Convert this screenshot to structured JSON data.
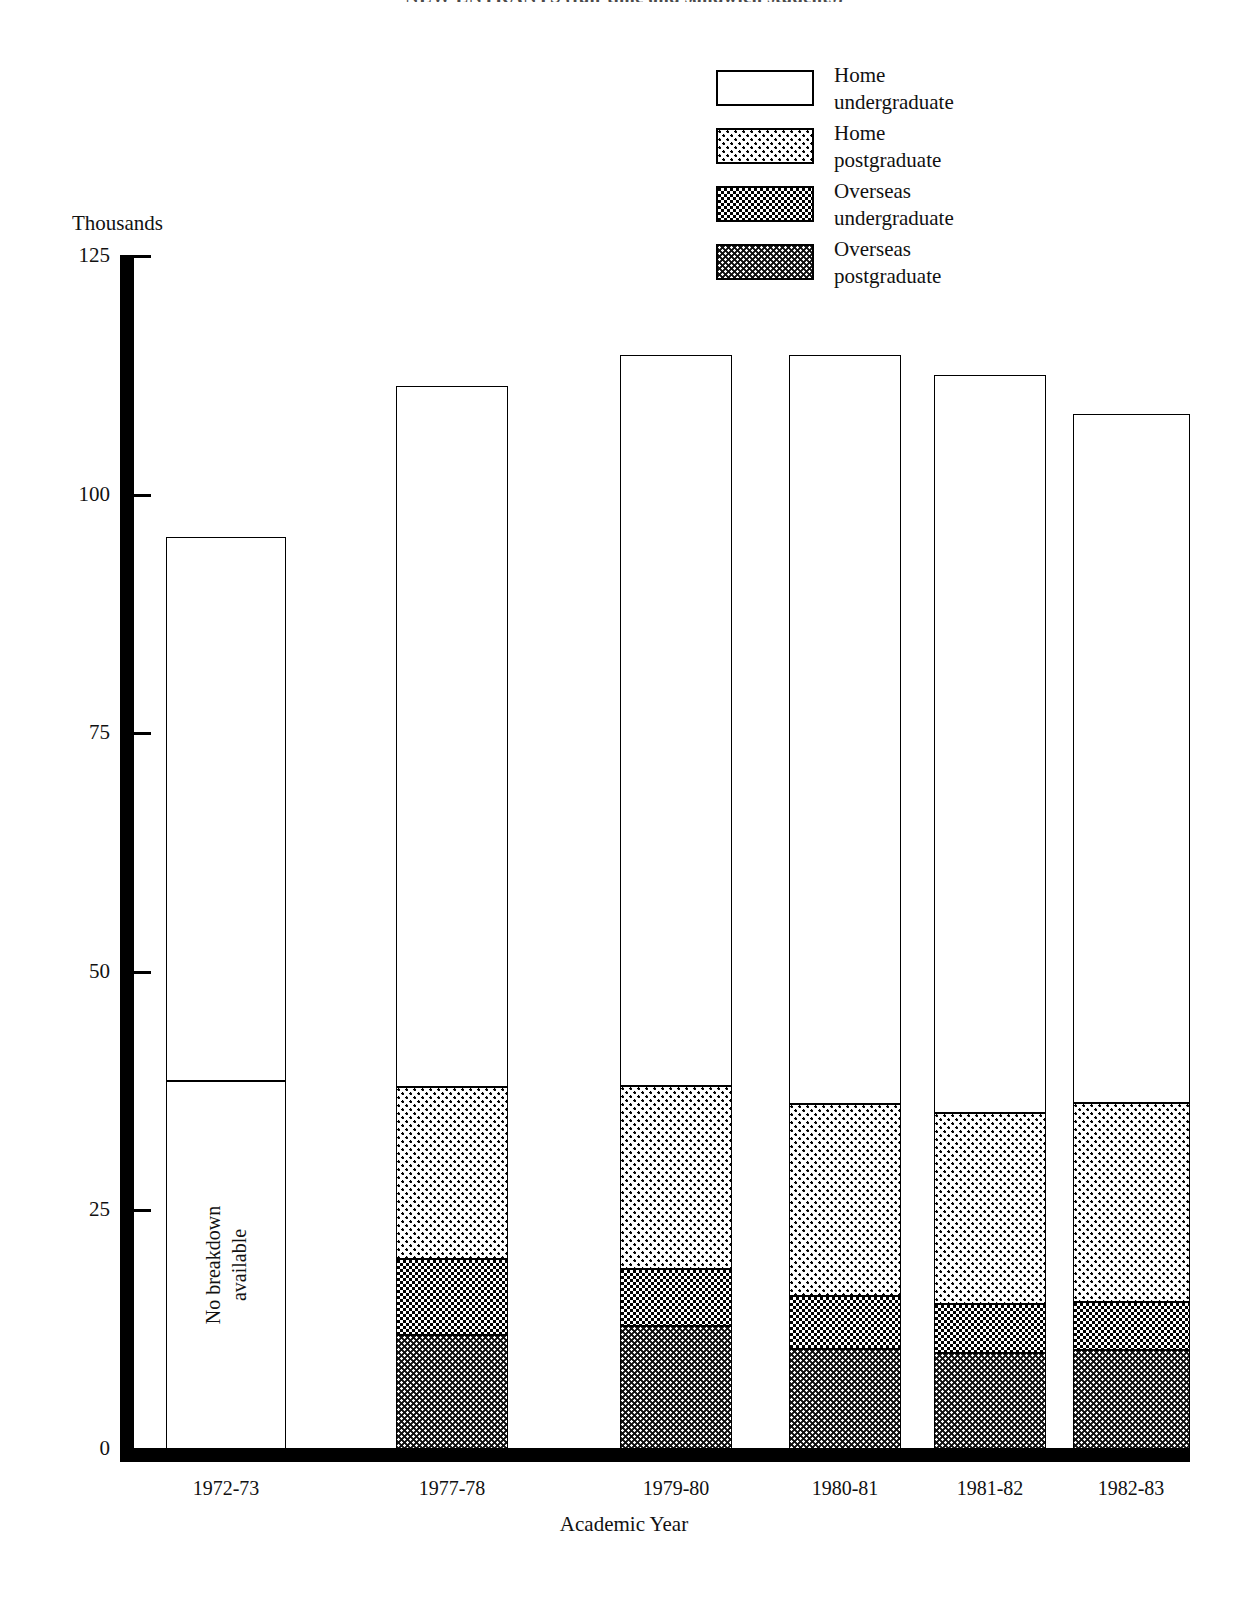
{
  "page": {
    "title": "NEW ENTRANTS (full-time and sandwich students)"
  },
  "axes": {
    "y_unit_label": "Thousands",
    "y_ticks": [
      "125",
      "100",
      "75",
      "50",
      "25",
      "0"
    ],
    "x_title": "Academic Year"
  },
  "legend": {
    "items": [
      {
        "label": "Home\nundergraduate",
        "pattern": "pat-none",
        "swatch_name": "legend-swatch-home-undergraduate"
      },
      {
        "label": "Home\npostgraduate",
        "pattern": "pat-light",
        "swatch_name": "legend-swatch-home-postgraduate"
      },
      {
        "label": "Overseas\nundergraduate",
        "pattern": "pat-mid",
        "swatch_name": "legend-swatch-overseas-undergraduate"
      },
      {
        "label": "Overseas\npostgraduate",
        "pattern": "pat-dark",
        "swatch_name": "legend-swatch-overseas-postgraduate"
      }
    ]
  },
  "annotations": {
    "no_breakdown": "No breakdown\navailable"
  },
  "chart_data": {
    "type": "bar",
    "subtype": "stacked-vertical",
    "title": "NEW ENTRANTS (full-time and sandwich students)",
    "xlabel": "Academic Year",
    "ylabel": "Thousands",
    "ylim": [
      0,
      125
    ],
    "yticks": [
      0,
      25,
      50,
      75,
      100,
      125
    ],
    "grid": false,
    "legend_position": "top-right",
    "categories": [
      "1972-73",
      "1977-78",
      "1979-80",
      "1980-81",
      "1981-82",
      "1982-83"
    ],
    "series": [
      {
        "name": "Overseas postgraduate",
        "pattern": "pat-dark",
        "values": [
          null,
          11.9,
          12.9,
          10.5,
          10.1,
          10.4
        ]
      },
      {
        "name": "Overseas undergraduate",
        "pattern": "pat-mid",
        "values": [
          null,
          8.0,
          6.0,
          5.5,
          5.1,
          5.0
        ]
      },
      {
        "name": "Home postgraduate",
        "pattern": "pat-light",
        "values": [
          null,
          18.0,
          19.1,
          20.1,
          20.0,
          20.8
        ]
      },
      {
        "name": "Home undergraduate",
        "pattern": "pat-none",
        "values": [
          null,
          73.5,
          76.6,
          78.5,
          77.3,
          72.2
        ]
      }
    ],
    "totals": [
      95.6,
      111.4,
      114.6,
      114.6,
      112.5,
      108.4
    ],
    "notes": [
      {
        "category": "1972-73",
        "text": "No breakdown available",
        "detail": "1972-73 bar is shown undivided with a single internal rule at 38.6 thousand"
      }
    ],
    "bars": [
      {
        "category": "1972-73",
        "total": 95.6,
        "breakdown_available": false,
        "segments": [
          {
            "series": "Unspecified lower",
            "pattern": "pat-none",
            "from": 0.0,
            "to": 38.6
          },
          {
            "series": "Unspecified upper",
            "pattern": "pat-none",
            "from": 38.6,
            "to": 95.6
          }
        ]
      },
      {
        "category": "1977-78",
        "total": 111.4,
        "breakdown_available": true,
        "segments": [
          {
            "series": "Overseas postgraduate",
            "pattern": "pat-dark",
            "from": 0.0,
            "to": 11.9
          },
          {
            "series": "Overseas undergraduate",
            "pattern": "pat-mid",
            "from": 11.9,
            "to": 19.9
          },
          {
            "series": "Home postgraduate",
            "pattern": "pat-light",
            "from": 19.9,
            "to": 37.9
          },
          {
            "series": "Home undergraduate",
            "pattern": "pat-none",
            "from": 37.9,
            "to": 111.4
          }
        ]
      },
      {
        "category": "1979-80",
        "total": 114.6,
        "breakdown_available": true,
        "segments": [
          {
            "series": "Overseas postgraduate",
            "pattern": "pat-dark",
            "from": 0.0,
            "to": 12.9
          },
          {
            "series": "Overseas undergraduate",
            "pattern": "pat-mid",
            "from": 12.9,
            "to": 18.9
          },
          {
            "series": "Home postgraduate",
            "pattern": "pat-light",
            "from": 18.9,
            "to": 38.0
          },
          {
            "series": "Home undergraduate",
            "pattern": "pat-none",
            "from": 38.0,
            "to": 114.6
          }
        ]
      },
      {
        "category": "1980-81",
        "total": 114.6,
        "breakdown_available": true,
        "segments": [
          {
            "series": "Overseas postgraduate",
            "pattern": "pat-dark",
            "from": 0.0,
            "to": 10.5
          },
          {
            "series": "Overseas undergraduate",
            "pattern": "pat-mid",
            "from": 10.5,
            "to": 16.0
          },
          {
            "series": "Home postgraduate",
            "pattern": "pat-light",
            "from": 16.0,
            "to": 36.1
          },
          {
            "series": "Home undergraduate",
            "pattern": "pat-none",
            "from": 36.1,
            "to": 114.6
          }
        ]
      },
      {
        "category": "1981-82",
        "total": 112.5,
        "breakdown_available": true,
        "segments": [
          {
            "series": "Overseas postgraduate",
            "pattern": "pat-dark",
            "from": 0.0,
            "to": 10.1
          },
          {
            "series": "Overseas undergraduate",
            "pattern": "pat-mid",
            "from": 10.1,
            "to": 15.2
          },
          {
            "series": "Home postgraduate",
            "pattern": "pat-light",
            "from": 15.2,
            "to": 35.2
          },
          {
            "series": "Home undergraduate",
            "pattern": "pat-none",
            "from": 35.2,
            "to": 112.5
          }
        ]
      },
      {
        "category": "1982-83",
        "total": 108.4,
        "breakdown_available": true,
        "segments": [
          {
            "series": "Overseas postgraduate",
            "pattern": "pat-dark",
            "from": 0.0,
            "to": 10.4
          },
          {
            "series": "Overseas undergraduate",
            "pattern": "pat-mid",
            "from": 10.4,
            "to": 15.4
          },
          {
            "series": "Home postgraduate",
            "pattern": "pat-light",
            "from": 15.4,
            "to": 36.2
          },
          {
            "series": "Home undergraduate",
            "pattern": "pat-none",
            "from": 36.2,
            "to": 108.4
          }
        ]
      }
    ]
  },
  "layout": {
    "plot": {
      "x0": 134,
      "x1": 1190,
      "y_zero": 1449,
      "y_top": 256,
      "y_max_value": 125
    },
    "bar_slots": [
      {
        "left": 166,
        "width": 120
      },
      {
        "left": 396,
        "width": 112
      },
      {
        "left": 620,
        "width": 112
      },
      {
        "left": 789,
        "width": 112
      },
      {
        "left": 934,
        "width": 112
      },
      {
        "left": 1073,
        "width": 117
      }
    ],
    "label_centers": [
      226,
      452,
      676,
      845,
      990,
      1131
    ]
  }
}
